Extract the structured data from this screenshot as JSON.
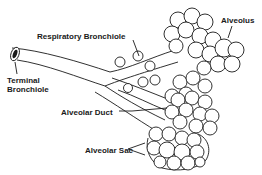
{
  "diagram": {
    "labels": {
      "respiratory_bronchiole": "Respiratory Bronchiole",
      "alveolus": "Alveolus",
      "terminal_bronchiole_line1": "Terminal",
      "terminal_bronchiole_line2": "Bronchiole",
      "alveolar_duct": "Alveolar Duct",
      "alveolar_sac": "Alveolar Sac"
    },
    "colors": {
      "line": "#1a1a1a",
      "background": "#ffffff"
    }
  }
}
